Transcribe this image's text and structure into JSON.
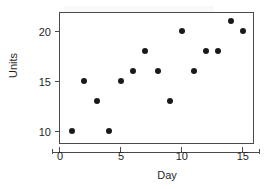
{
  "chart_data": {
    "type": "scatter",
    "title": "",
    "xlabel": "Day",
    "ylabel": "Units",
    "xlim": [
      0,
      16
    ],
    "ylim": [
      8.6,
      21.8
    ],
    "grid": false,
    "legend": null,
    "xticks": [
      0,
      5,
      10,
      15
    ],
    "xtick_labels": [
      "0",
      "5",
      "10",
      "15"
    ],
    "yticks": [
      10,
      15,
      20
    ],
    "ytick_labels": [
      "10",
      "15",
      "20"
    ],
    "marker": "filled-circle",
    "marker_color": "#1a1a1a",
    "x": [
      1,
      2,
      3,
      4,
      5,
      6,
      7,
      8,
      9,
      10,
      11,
      12,
      13,
      14,
      15
    ],
    "y": [
      10,
      15,
      13,
      10,
      15,
      16,
      18,
      16,
      13,
      20,
      16,
      18,
      18,
      21,
      20
    ],
    "points": [
      {
        "x": 1,
        "y": 10
      },
      {
        "x": 2,
        "y": 15
      },
      {
        "x": 3,
        "y": 13
      },
      {
        "x": 4,
        "y": 10
      },
      {
        "x": 5,
        "y": 15
      },
      {
        "x": 6,
        "y": 16
      },
      {
        "x": 7,
        "y": 18
      },
      {
        "x": 8,
        "y": 16
      },
      {
        "x": 9,
        "y": 13
      },
      {
        "x": 10,
        "y": 20
      },
      {
        "x": 11,
        "y": 16
      },
      {
        "x": 12,
        "y": 18
      },
      {
        "x": 13,
        "y": 18
      },
      {
        "x": 14,
        "y": 21
      },
      {
        "x": 15,
        "y": 20
      }
    ]
  },
  "axes": {
    "x_title": "Day",
    "y_title": "Units"
  }
}
